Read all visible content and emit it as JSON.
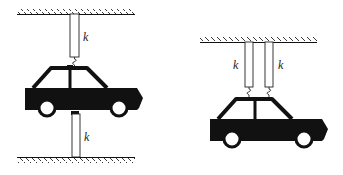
{
  "diagrams": [
    {
      "id": "left",
      "description": "car between two springs: one from ceiling, one from floor",
      "springs": [
        {
          "label": "k",
          "position": "top"
        },
        {
          "label": "k",
          "position": "bottom"
        }
      ]
    },
    {
      "id": "right",
      "description": "car suspended by two parallel springs from ceiling",
      "springs": [
        {
          "label": "k",
          "position": "left"
        },
        {
          "label": "k",
          "position": "right"
        }
      ]
    }
  ],
  "colors": {
    "ink": "#111111",
    "background": "#ffffff"
  }
}
